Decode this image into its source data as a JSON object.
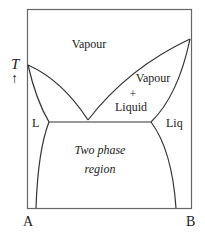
{
  "diagram": {
    "type": "binary phase diagram (minimum-boiling azeotrope with solid/liquid immiscibility)",
    "axis_y_label": "T",
    "axis_y_arrow": "↑",
    "axis_x_left_label": "A",
    "axis_x_right_label": "B",
    "regions": {
      "vapour": "Vapour",
      "vapour_liquid_line1": "Vapour",
      "vapour_liquid_plus": "+",
      "vapour_liquid_line2": "Liquid",
      "left_liquid": "L",
      "right_liquid": "Liq",
      "two_phase_line1": "Two phase",
      "two_phase_line2": "region"
    },
    "colors": {
      "line": "#333333",
      "frame": "#555555",
      "text": "#222222",
      "background": "#ffffff"
    }
  }
}
